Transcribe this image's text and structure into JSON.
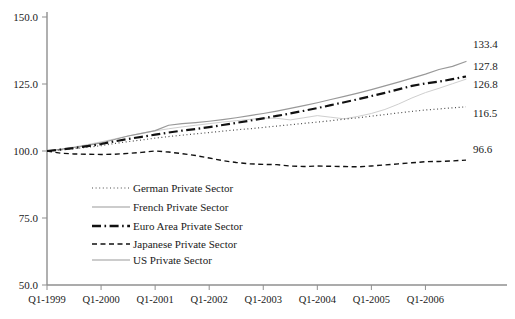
{
  "chart_data": {
    "type": "line",
    "title": "",
    "xlabel": "",
    "ylabel": "",
    "ylim": [
      50.0,
      150.0
    ],
    "yticks": [
      "50.0",
      "75.0",
      "100.0",
      "125.0",
      "150.0"
    ],
    "ytick_values": [
      50.0,
      75.0,
      100.0,
      125.0,
      150.0
    ],
    "grid": false,
    "legend_position": "inside-lower-left",
    "x": [
      "Q1-1999",
      "Q2-1999",
      "Q3-1999",
      "Q4-1999",
      "Q1-2000",
      "Q2-2000",
      "Q3-2000",
      "Q4-2000",
      "Q1-2001",
      "Q2-2001",
      "Q3-2001",
      "Q4-2001",
      "Q1-2002",
      "Q2-2002",
      "Q3-2002",
      "Q4-2002",
      "Q1-2003",
      "Q2-2003",
      "Q3-2003",
      "Q4-2003",
      "Q1-2004",
      "Q2-2004",
      "Q3-2004",
      "Q4-2004",
      "Q1-2005",
      "Q2-2005",
      "Q3-2005",
      "Q4-2005",
      "Q1-2006",
      "Q2-2006",
      "Q3-2006",
      "Q4-2006"
    ],
    "xtick_labels": [
      "Q1-1999",
      "Q1-2000",
      "Q1-2001",
      "Q1-2002",
      "Q1-2003",
      "Q1-2004",
      "Q1-2005",
      "Q1-2006"
    ],
    "xtick_positions": [
      0,
      4,
      8,
      12,
      16,
      20,
      24,
      28
    ],
    "series": [
      {
        "name": "German Private Sector",
        "style": "dotted",
        "color": "#4a4a4a",
        "width": 1.2,
        "end_label": "116.5",
        "end_value": 116.5,
        "values": [
          100.0,
          100.4,
          100.9,
          101.4,
          102.0,
          102.8,
          103.5,
          104.1,
          104.8,
          105.4,
          105.9,
          106.4,
          106.9,
          107.4,
          107.9,
          108.3,
          108.8,
          109.3,
          109.8,
          110.3,
          110.8,
          111.3,
          111.9,
          112.4,
          113.0,
          113.6,
          114.2,
          114.8,
          115.3,
          115.7,
          116.1,
          116.5
        ]
      },
      {
        "name": "French Private Sector",
        "style": "solid",
        "color": "#999999",
        "width": 1.2,
        "end_label": "133.4",
        "end_value": 133.4,
        "values": [
          100.0,
          100.6,
          101.3,
          102.1,
          103.0,
          104.3,
          105.6,
          106.6,
          107.6,
          109.6,
          110.2,
          110.6,
          111.1,
          111.7,
          112.4,
          113.2,
          114.0,
          114.9,
          115.9,
          116.9,
          118.0,
          119.2,
          120.4,
          121.6,
          122.9,
          124.3,
          125.7,
          127.2,
          128.7,
          130.4,
          131.6,
          133.4
        ]
      },
      {
        "name": "Euro Area Private Sector",
        "style": "dashdot",
        "color": "#111111",
        "width": 2.2,
        "end_label": "127.8",
        "end_value": 127.8,
        "values": [
          100.0,
          100.5,
          101.1,
          101.8,
          102.6,
          103.6,
          104.5,
          105.3,
          106.1,
          106.9,
          107.6,
          108.2,
          108.9,
          109.7,
          110.5,
          111.3,
          112.2,
          113.1,
          114.0,
          115.0,
          116.0,
          117.1,
          118.2,
          119.3,
          120.5,
          121.7,
          123.0,
          124.3,
          125.2,
          125.9,
          126.8,
          127.8
        ]
      },
      {
        "name": "Japanese Private Sector",
        "style": "dashed",
        "color": "#111111",
        "width": 1.4,
        "end_label": "96.6",
        "end_value": 96.6,
        "values": [
          100.0,
          99.2,
          98.9,
          98.8,
          98.7,
          98.8,
          99.1,
          99.5,
          100.0,
          99.6,
          99.0,
          98.3,
          97.4,
          96.4,
          95.7,
          95.2,
          95.0,
          94.9,
          94.4,
          94.2,
          94.4,
          94.3,
          94.2,
          94.1,
          94.4,
          94.8,
          95.2,
          95.6,
          96.0,
          96.1,
          96.3,
          96.6
        ]
      },
      {
        "name": "US  Private Sector",
        "style": "solid",
        "color": "#cfcfcf",
        "width": 1.0,
        "end_label": "126.8",
        "end_value": 126.8,
        "values": [
          100.0,
          100.7,
          101.5,
          102.4,
          103.4,
          104.5,
          105.6,
          106.6,
          107.5,
          108.3,
          109.0,
          109.6,
          110.2,
          110.8,
          111.3,
          111.8,
          112.3,
          112.2,
          111.6,
          112.4,
          113.2,
          112.6,
          112.0,
          112.9,
          114.0,
          115.5,
          117.5,
          119.8,
          121.8,
          123.4,
          125.1,
          126.8
        ]
      }
    ]
  },
  "legend": {
    "items": [
      {
        "label": "German Private Sector",
        "style": "dotted"
      },
      {
        "label": "French Private Sector",
        "style": "solid-gray"
      },
      {
        "label": "Euro Area Private Sector",
        "style": "dashdot"
      },
      {
        "label": "Japanese Private Sector",
        "style": "dashed"
      },
      {
        "label": "US  Private Sector",
        "style": "solid-gray"
      }
    ]
  }
}
